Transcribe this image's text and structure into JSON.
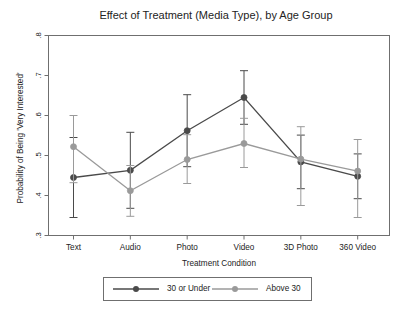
{
  "chart_data": {
    "type": "line",
    "title": "Effect of Treatment (Media Type), by Age Group",
    "xlabel": "Treatment Condition",
    "ylabel": "Probability of Being 'Very Interested'",
    "categories": [
      "Text",
      "Audio",
      "Photo",
      "Video",
      "3D Photo",
      "360 Video"
    ],
    "ylim": [
      0.3,
      0.8
    ],
    "yticks": [
      0.8,
      0.7,
      0.6,
      0.5,
      0.4,
      0.3
    ],
    "ytick_labels": [
      ".8",
      ".7",
      ".6",
      ".5",
      ".4",
      ".3"
    ],
    "grid": false,
    "legend_position": "below-plot",
    "error_bars": "95% confidence interval",
    "series": [
      {
        "name": "30 or Under",
        "color": "#4a4a4a",
        "values": [
          0.445,
          0.463,
          0.562,
          0.645,
          0.484,
          0.448
        ],
        "ci_low": [
          0.345,
          0.368,
          0.472,
          0.578,
          0.417,
          0.392
        ],
        "ci_high": [
          0.545,
          0.558,
          0.652,
          0.712,
          0.551,
          0.504
        ]
      },
      {
        "name": "Above 30",
        "color": "#9a9a9a",
        "values": [
          0.522,
          0.412,
          0.49,
          0.53,
          0.491,
          0.461
        ],
        "ci_low": [
          0.432,
          0.348,
          0.43,
          0.47,
          0.375,
          0.345
        ],
        "ci_high": [
          0.6,
          0.475,
          0.552,
          0.593,
          0.572,
          0.54
        ]
      }
    ]
  },
  "legend": {
    "entries": [
      {
        "label": "30 or Under"
      },
      {
        "label": "Above 30"
      }
    ]
  }
}
